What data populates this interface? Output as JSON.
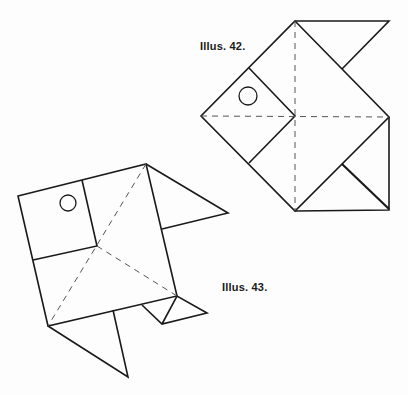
{
  "figures": [
    {
      "id": "fish",
      "caption": "Illus. 42.",
      "subject": "origami fish"
    },
    {
      "id": "bird",
      "caption": "Illus. 43.",
      "subject": "origami bird"
    }
  ],
  "colors": {
    "line": "#1a1a1a",
    "fold": "#555555",
    "background": "#fdfdfd"
  }
}
